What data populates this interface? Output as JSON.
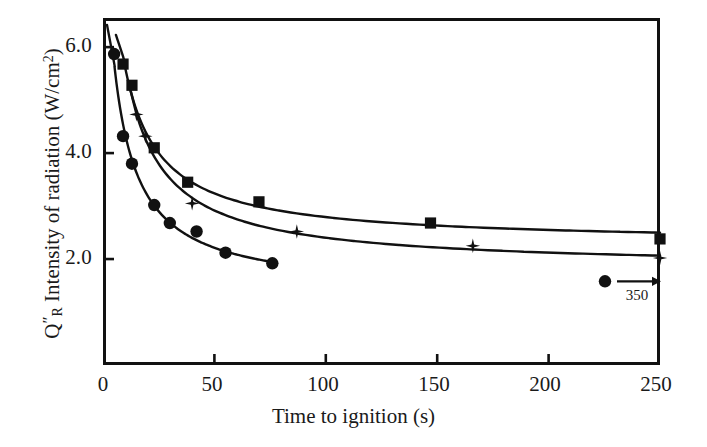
{
  "figure": {
    "background": "#ffffff",
    "ink_color": "#111111"
  },
  "axes": {
    "x": {
      "title": "Time to ignition (s)",
      "ticks": [
        0,
        50,
        100,
        150,
        200,
        250
      ],
      "tick_labels": [
        "0",
        "50",
        "100",
        "150",
        "200",
        "250"
      ],
      "min": 0,
      "max": 250
    },
    "y": {
      "title_plain": "Q\"R Intensity of radiation (W/cm2)",
      "title_parts": {
        "symbol": "Q",
        "prime": "″",
        "subscript": "R",
        "text": " Intensity of radiation (W/cm",
        "superscript": "2",
        "close": ")"
      },
      "ticks": [
        2.0,
        4.0,
        6.0
      ],
      "tick_labels": [
        "2.0",
        "4.0",
        "6.0"
      ],
      "min": 0.0,
      "max": 6.55
    }
  },
  "annotation": {
    "marker": "circle",
    "arrow": "→",
    "label": "350",
    "meaning": "off-scale circle datum at 350 s"
  },
  "chart_data": {
    "type": "scatter",
    "title": "",
    "xlabel": "Time to ignition (s)",
    "ylabel": "Q″R Intensity of radiation (W/cm²)",
    "xlim": [
      0,
      250
    ],
    "ylim": [
      0,
      6.55
    ],
    "grid": false,
    "legend": "none",
    "series": [
      {
        "name": "circles",
        "marker": "circle",
        "points": [
          {
            "x": 5,
            "y": 5.87
          },
          {
            "x": 9,
            "y": 4.32
          },
          {
            "x": 13,
            "y": 3.8
          },
          {
            "x": 23,
            "y": 3.02
          },
          {
            "x": 30,
            "y": 2.68
          },
          {
            "x": 42,
            "y": 2.52
          },
          {
            "x": 55,
            "y": 2.12
          },
          {
            "x": 76,
            "y": 1.92
          },
          {
            "x": 350,
            "y": 1.58,
            "offscale": true
          }
        ]
      },
      {
        "name": "squares",
        "marker": "square",
        "points": [
          {
            "x": 9,
            "y": 5.68
          },
          {
            "x": 13,
            "y": 5.28
          },
          {
            "x": 23,
            "y": 4.1
          },
          {
            "x": 38,
            "y": 3.45
          },
          {
            "x": 70,
            "y": 3.08
          },
          {
            "x": 147,
            "y": 2.68
          },
          {
            "x": 250,
            "y": 2.38
          }
        ]
      },
      {
        "name": "stars",
        "marker": "star",
        "points": [
          {
            "x": 15,
            "y": 4.73
          },
          {
            "x": 19,
            "y": 4.32
          },
          {
            "x": 40,
            "y": 3.05
          },
          {
            "x": 87,
            "y": 2.52
          },
          {
            "x": 166,
            "y": 2.25
          },
          {
            "x": 250,
            "y": 2.02
          }
        ]
      }
    ],
    "fit_curves": [
      {
        "name": "squares-fit",
        "note": "smooth decaying curve through square markers"
      },
      {
        "name": "stars-fit",
        "note": "smooth decaying curve through star markers"
      },
      {
        "name": "circles-fit",
        "note": "smooth decaying curve through circle markers"
      }
    ]
  }
}
